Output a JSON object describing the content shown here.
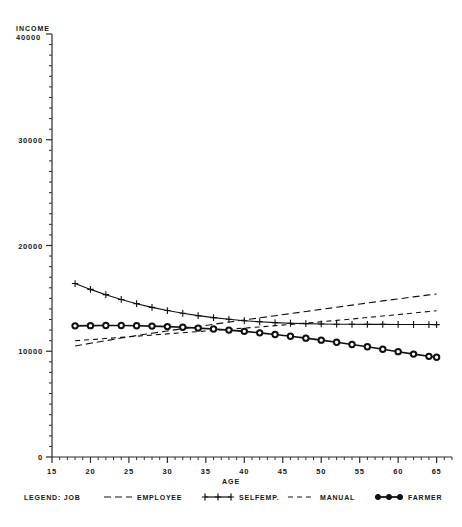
{
  "chart_data": {
    "type": "line",
    "title": "",
    "xlabel": "AGE",
    "ylabel": "INCOME",
    "xlim": [
      15,
      67
    ],
    "ylim": [
      0,
      40000
    ],
    "grid": false,
    "legend_position": "bottom",
    "legend_title": "LEGEND: JOB",
    "x_ticks": [
      15,
      20,
      25,
      30,
      35,
      40,
      45,
      50,
      55,
      60,
      65
    ],
    "x_tick_labels": [
      "15",
      "20",
      "25",
      "30",
      "35",
      "40",
      "45",
      "50",
      "55",
      "60",
      "65"
    ],
    "y_ticks": [
      0,
      10000,
      20000,
      30000,
      40000
    ],
    "y_tick_labels": [
      "0",
      "10000",
      "20000",
      "30000",
      "40000"
    ],
    "x": [
      18,
      20,
      22,
      24,
      26,
      28,
      30,
      32,
      34,
      36,
      38,
      40,
      42,
      44,
      46,
      48,
      50,
      52,
      54,
      56,
      58,
      60,
      62,
      64,
      65
    ],
    "series": [
      {
        "name": "EMPLOYEE",
        "style": "dashed",
        "marker": "none",
        "values": [
          10500,
          10750,
          11000,
          11250,
          11480,
          11700,
          11920,
          12130,
          12340,
          12550,
          12760,
          12960,
          13160,
          13360,
          13560,
          13760,
          13960,
          14160,
          14360,
          14560,
          14760,
          14950,
          15140,
          15330,
          15420
        ]
      },
      {
        "name": "SELFEMP.",
        "style": "solid",
        "marker": "plus",
        "values": [
          16400,
          15850,
          15350,
          14900,
          14500,
          14150,
          13850,
          13590,
          13370,
          13180,
          13020,
          12890,
          12790,
          12710,
          12650,
          12610,
          12580,
          12560,
          12550,
          12545,
          12540,
          12535,
          12530,
          12525,
          12520
        ]
      },
      {
        "name": "MANUAL",
        "style": "dashed",
        "marker": "none",
        "values": [
          11000,
          11100,
          11200,
          11310,
          11420,
          11530,
          11640,
          11750,
          11860,
          11970,
          12080,
          12190,
          12300,
          12420,
          12540,
          12660,
          12790,
          12920,
          13050,
          13190,
          13330,
          13470,
          13610,
          13760,
          13830
        ]
      },
      {
        "name": "FARMER",
        "style": "solid",
        "marker": "circle",
        "values": [
          12400,
          12420,
          12430,
          12430,
          12410,
          12380,
          12330,
          12270,
          12190,
          12100,
          12000,
          11880,
          11740,
          11590,
          11420,
          11240,
          11050,
          10850,
          10640,
          10420,
          10190,
          9960,
          9730,
          9520,
          9430
        ]
      }
    ]
  },
  "legend": {
    "title": "LEGEND: JOB",
    "entries": [
      {
        "label": "EMPLOYEE",
        "glyph": "dashed-line-swatch"
      },
      {
        "label": "SELFEMP.",
        "glyph": "plus-marker-line-swatch"
      },
      {
        "label": "MANUAL",
        "glyph": "dashed-line-swatch"
      },
      {
        "label": "FARMER",
        "glyph": "circle-marker-line-swatch"
      }
    ]
  },
  "axes": {
    "y_title_line1": "INCOME",
    "y_title_line2": "40000",
    "x_title": "AGE"
  }
}
